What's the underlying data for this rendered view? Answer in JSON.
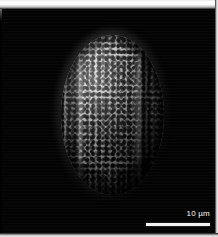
{
  "image": {
    "kind": "sem-micrograph",
    "subject": "pollen-grain",
    "background_color": "#000000",
    "specimen_color": "#b4b4b4",
    "alt_text": "Scanning electron micrograph of a single reticulate pollen grain"
  },
  "specimen": {
    "shape": "ellipsoid",
    "surface_pattern": "reticulate",
    "aperture_type": "colpi",
    "aperture_count": 3
  },
  "scalebar": {
    "label": "10 µm",
    "value": 10,
    "unit": "µm",
    "bar_color": "#f4f4f4",
    "text_color": "#ffffff"
  },
  "frame": {
    "top_border_color": "#ffffff",
    "right_border_color": "#f2f2f2",
    "bottom_border_color": "#eaeaea"
  }
}
